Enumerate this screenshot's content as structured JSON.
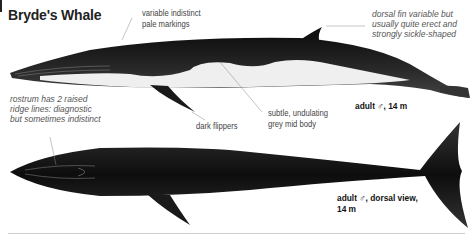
{
  "title": "Bryde's Whale",
  "side_view": {
    "annotations": {
      "pale_markings": "variable indistinct\npale markings",
      "dorsal_fin": [
        "dorsal fin variable but",
        "usually quite erect and",
        "strongly sickle-shaped"
      ],
      "rostrum": [
        "rostrum has 2 raised",
        "ridge lines: diagnostic",
        "but sometimes indistinct"
      ],
      "mid_body": [
        "subtle, undulating",
        "grey mid body"
      ],
      "flippers": "dark flippers"
    },
    "caption": "adult ♂, 14 m"
  },
  "dorsal_view": {
    "caption_line1": "adult ♂, dorsal view,",
    "caption_line2": "14 m"
  },
  "colors": {
    "body_dark": "#1a1a1a",
    "belly_light": "#f2f2f2",
    "text": "#222222",
    "note_text": "#555555"
  }
}
